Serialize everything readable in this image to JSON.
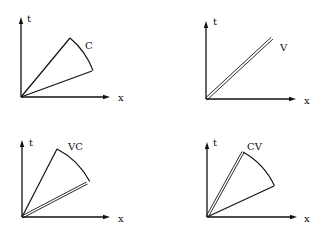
{
  "figure": {
    "panels": [
      {
        "id": "C",
        "label": "C",
        "axis_t": "t",
        "axis_x": "x",
        "origin": [
          21,
          97
        ],
        "t_top": [
          21,
          17
        ],
        "x_end": [
          110,
          97
        ],
        "upper": [
          70,
          38
        ],
        "lower": [
          92,
          71
        ],
        "label_pos": [
          85,
          49
        ],
        "t_label_pos": [
          27,
          22
        ],
        "x_label_pos": [
          118,
          101
        ],
        "double_edge": "none",
        "has_arc": true
      },
      {
        "id": "V",
        "label": "V",
        "axis_t": "t",
        "axis_x": "x",
        "origin": [
          206,
          99
        ],
        "t_top": [
          206,
          21
        ],
        "x_end": [
          296,
          99
        ],
        "upper": [
          272,
          38
        ],
        "lower": [
          272,
          38
        ],
        "label_pos": [
          280,
          51
        ],
        "t_label_pos": [
          213,
          25
        ],
        "x_label_pos": [
          304,
          104
        ],
        "double_edge": "single",
        "has_arc": false
      },
      {
        "id": "VC",
        "label": "VC",
        "axis_t": "t",
        "axis_x": "x",
        "origin": [
          22,
          217
        ],
        "t_top": [
          22,
          140
        ],
        "x_end": [
          110,
          217
        ],
        "upper": [
          57,
          149
        ],
        "lower": [
          87,
          183
        ],
        "label_pos": [
          68,
          150
        ],
        "t_label_pos": [
          29,
          146
        ],
        "x_label_pos": [
          118,
          222
        ],
        "double_edge": "lower",
        "has_arc": true
      },
      {
        "id": "CV",
        "label": "CV",
        "axis_t": "t",
        "axis_x": "x",
        "origin": [
          207,
          217
        ],
        "t_top": [
          207,
          142
        ],
        "x_end": [
          297,
          217
        ],
        "upper": [
          243,
          152
        ],
        "lower": [
          274,
          186
        ],
        "label_pos": [
          247,
          150
        ],
        "t_label_pos": [
          213,
          146
        ],
        "x_label_pos": [
          304,
          222
        ],
        "double_edge": "upper",
        "has_arc": true
      }
    ]
  }
}
